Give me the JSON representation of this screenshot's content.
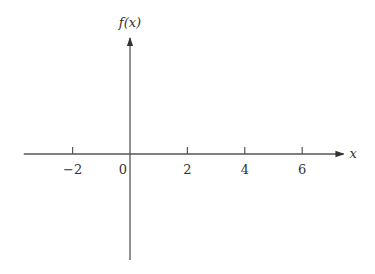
{
  "chart_data": {
    "type": "line",
    "title": "",
    "xlabel": "x",
    "ylabel": "f(x)",
    "x_ticks": [
      -2,
      0,
      2,
      4,
      6
    ],
    "x_tick_labels": [
      "−2",
      "0",
      "2",
      "4",
      "6"
    ],
    "xlim": [
      -3.7,
      7.3
    ],
    "series": [],
    "grid": false,
    "legend": "none"
  }
}
